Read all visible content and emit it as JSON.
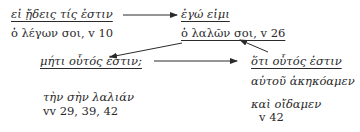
{
  "nodes": {
    "n1": {
      "heading": "εἰ ᾔδεις τίς ἐστιν",
      "ref": "ὁ λέγων σοι, v 10"
    },
    "n2": {
      "heading": "ἐγώ εἰμι",
      "ref": "ὁ λαλῶν σοι, v 26"
    },
    "n3": {
      "heading": "μήτι οὗτός ἐστιν;"
    },
    "n4": {
      "heading": "ὅτι οὗτός ἐστιν",
      "line1": "αὐτοῦ ἀκηκόαμεν",
      "line2": "καὶ οἴδαμεν",
      "ref": "v 42"
    },
    "n5": {
      "line1": "τὴν σὴν λαλιάν",
      "ref": "vv 29, 39, 42"
    }
  },
  "arrows": [
    {
      "from": "n1",
      "to": "n2",
      "direction": "right"
    },
    {
      "from": "n2",
      "to": "n3",
      "direction": "down-left"
    },
    {
      "from": "n3",
      "to": "n4",
      "direction": "right"
    },
    {
      "from": "n4",
      "to": "n2",
      "direction": "up-left"
    }
  ]
}
